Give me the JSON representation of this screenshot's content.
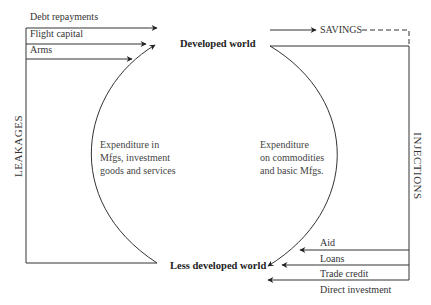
{
  "nodes": {
    "developed": "Developed world",
    "less_developed": "Less developed world"
  },
  "leakages": {
    "label": "LEAKAGES",
    "items": [
      "Debt repayments",
      "Flight capital",
      "Arms"
    ]
  },
  "injections": {
    "label": "INJECTIONS",
    "items": [
      "Aid",
      "Loans",
      "Trade credit",
      "Direct investment"
    ]
  },
  "savings": "SAVINGS",
  "flows": {
    "left_arc": [
      "Expenditure in",
      "Mfgs, investment",
      "goods and services"
    ],
    "right_arc": [
      "Expenditure",
      "on commodities",
      "and basic Mfgs."
    ]
  }
}
